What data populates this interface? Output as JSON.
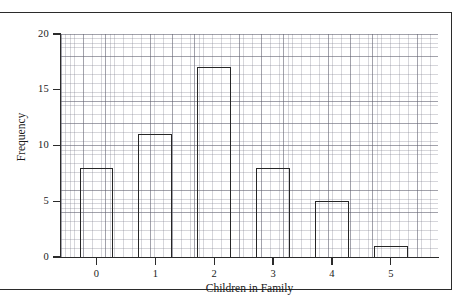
{
  "figure": {
    "frame_color": "#2b2b2b",
    "background": "#ffffff"
  },
  "chart_data": {
    "type": "bar",
    "title": "",
    "subtitle": "",
    "xlabel": "Children in Family",
    "ylabel": "Frequency",
    "categories": [
      "0",
      "1",
      "2",
      "3",
      "4",
      "5"
    ],
    "values": [
      8,
      11,
      17,
      8,
      5,
      1
    ],
    "series": [
      {
        "name": "Frequency",
        "values": [
          8,
          11,
          17,
          8,
          5,
          1
        ]
      }
    ],
    "xlim": [
      -0.6,
      5.8
    ],
    "ylim": [
      0,
      20
    ],
    "y_ticks": [
      0,
      5,
      10,
      15,
      20
    ],
    "y_tick_labels": [
      "0",
      "5",
      "10",
      "15",
      "20"
    ],
    "x_ticks": [
      0,
      1,
      2,
      3,
      4,
      5
    ],
    "x_tick_labels": [
      "0",
      "1",
      "2",
      "3",
      "4",
      "5"
    ],
    "grid": true,
    "grid_minor": true,
    "legend": false,
    "legend_position": "none",
    "bar_fill": "#ffffff",
    "bar_edge_color": "#262626",
    "annotations": []
  }
}
